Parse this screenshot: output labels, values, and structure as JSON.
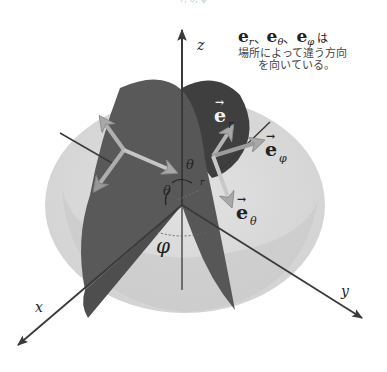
{
  "top_fragment": "· · · r, θ, φ · · ·",
  "caption": {
    "vectors": [
      {
        "base": "e",
        "sub": "r"
      },
      {
        "base": "e",
        "sub": "θ"
      },
      {
        "base": "e",
        "sub": "φ"
      }
    ],
    "separator": "、",
    "particle": "は",
    "line1": "場所によって違う方向",
    "line2": "を向いている。"
  },
  "axes": {
    "x": "x",
    "y": "y",
    "z": "z"
  },
  "angles": {
    "theta_upper": "θ",
    "theta_lower": "θ",
    "phi": "φ",
    "r": "r"
  },
  "vector_labels": {
    "e_r": {
      "base": "e",
      "sub": "r"
    },
    "e_theta": {
      "base": "e",
      "sub": "θ"
    },
    "e_phi": {
      "base": "e",
      "sub": "φ"
    }
  },
  "colors": {
    "background": "#ffffff",
    "outer_sphere": "#d9d9d9",
    "inner_hemisphere": "#c4c4c4",
    "plane_dark": "#5a5a5a",
    "plane_darker": "#3f3f3f",
    "axis": "#3a3a3a",
    "vector_arrow": "#b8b8b8",
    "text": "#222222"
  }
}
